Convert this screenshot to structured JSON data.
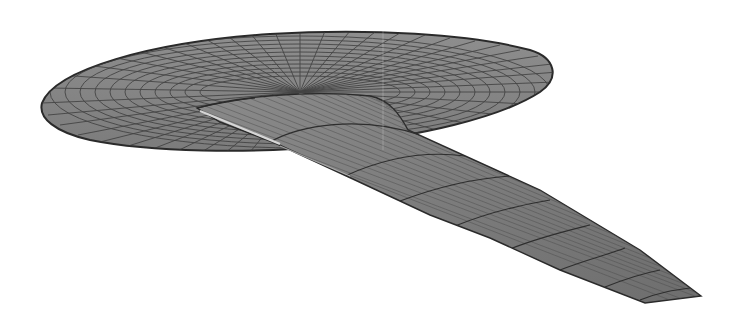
{
  "figure": {
    "background_color": "#ffffff",
    "surface_color": "#8a8a8a",
    "mesh_line_color": "#3a3a3a",
    "highlight_color": "#cfcfcf",
    "parts": [
      {
        "name": "disk-body",
        "label": "Elliptical disk body"
      },
      {
        "name": "wing",
        "label": "Swept tapered wing"
      }
    ]
  }
}
